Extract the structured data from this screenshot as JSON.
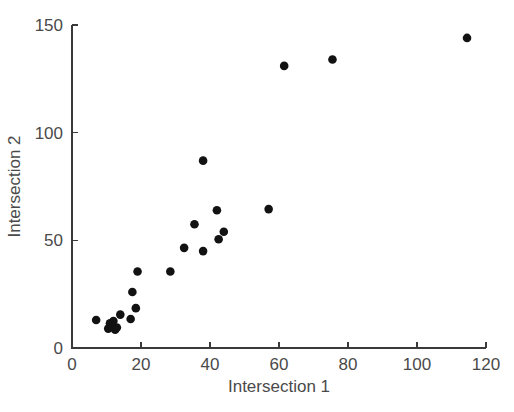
{
  "chart_data": {
    "type": "scatter",
    "title": "",
    "xlabel": "Intersection 1",
    "ylabel": "Intersection 2",
    "xlim": [
      0,
      120
    ],
    "ylim": [
      0,
      150
    ],
    "xticks": [
      0,
      20,
      40,
      60,
      80,
      100,
      120
    ],
    "yticks": [
      0,
      50,
      100,
      150
    ],
    "xtick_labels": [
      "0",
      "20",
      "40",
      "60",
      "80",
      "100",
      "120"
    ],
    "ytick_labels": [
      "0",
      "50",
      "100",
      "150"
    ],
    "grid": false,
    "legend": null,
    "marker_color": "#121212",
    "marker_shape": "circle",
    "axis_color": "#3a3a3a",
    "background": "#ffffff",
    "points": [
      {
        "x": 7.0,
        "y": 13.0
      },
      {
        "x": 10.5,
        "y": 9.0
      },
      {
        "x": 11.0,
        "y": 11.5
      },
      {
        "x": 11.5,
        "y": 10.0
      },
      {
        "x": 12.0,
        "y": 12.5
      },
      {
        "x": 12.5,
        "y": 8.5
      },
      {
        "x": 13.0,
        "y": 9.5
      },
      {
        "x": 14.0,
        "y": 15.5
      },
      {
        "x": 17.0,
        "y": 13.5
      },
      {
        "x": 17.5,
        "y": 26.0
      },
      {
        "x": 18.5,
        "y": 18.5
      },
      {
        "x": 19.0,
        "y": 35.5
      },
      {
        "x": 28.5,
        "y": 35.5
      },
      {
        "x": 32.5,
        "y": 46.5
      },
      {
        "x": 35.5,
        "y": 57.5
      },
      {
        "x": 38.0,
        "y": 45.0
      },
      {
        "x": 38.0,
        "y": 87.0
      },
      {
        "x": 42.0,
        "y": 64.0
      },
      {
        "x": 42.5,
        "y": 50.5
      },
      {
        "x": 44.0,
        "y": 54.0
      },
      {
        "x": 57.0,
        "y": 64.5
      },
      {
        "x": 61.5,
        "y": 131.0
      },
      {
        "x": 75.5,
        "y": 134.0
      },
      {
        "x": 114.5,
        "y": 144.0
      }
    ]
  }
}
